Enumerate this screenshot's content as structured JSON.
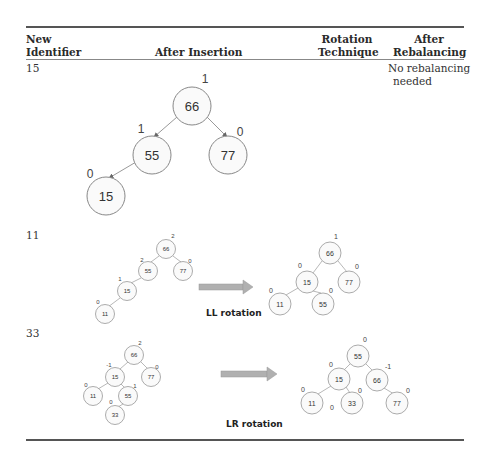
{
  "table": {
    "headers": {
      "new_identifier": [
        "New",
        "Identifier"
      ],
      "after_insertion": "After Insertion",
      "rotation_technique": [
        "Rotation",
        "Technique"
      ],
      "after_rebalancing": [
        "After",
        "Rebalancing"
      ]
    },
    "rows": [
      {
        "identifier": "15",
        "after_insertion_tree": {
          "nodes": [
            {
              "key": "66",
              "balance": "1"
            },
            {
              "key": "55",
              "balance": "1"
            },
            {
              "key": "77",
              "balance": "0"
            },
            {
              "key": "15",
              "balance": "0"
            }
          ]
        },
        "rotation_technique": "",
        "after_rebalancing": [
          "No rebalancing",
          "needed"
        ]
      },
      {
        "identifier": "11",
        "after_insertion_tree": {
          "nodes": [
            {
              "key": "66",
              "balance": "2"
            },
            {
              "key": "55",
              "balance": "2"
            },
            {
              "key": "77",
              "balance": "0"
            },
            {
              "key": "15",
              "balance": "1"
            },
            {
              "key": "11",
              "balance": "0"
            }
          ]
        },
        "rotation_technique": "LL rotation",
        "after_rebalancing_tree": {
          "nodes": [
            {
              "key": "66",
              "balance": "1"
            },
            {
              "key": "15",
              "balance": "0"
            },
            {
              "key": "77",
              "balance": "0"
            },
            {
              "key": "11",
              "balance": "0"
            },
            {
              "key": "55",
              "balance": "0"
            }
          ]
        }
      },
      {
        "identifier": "33",
        "after_insertion_tree": {
          "nodes": [
            {
              "key": "66",
              "balance": "2"
            },
            {
              "key": "15",
              "balance": "-1"
            },
            {
              "key": "77",
              "balance": "0"
            },
            {
              "key": "11",
              "balance": "0"
            },
            {
              "key": "55",
              "balance": "1"
            },
            {
              "key": "33",
              "balance": "0"
            }
          ]
        },
        "rotation_technique": "LR rotation",
        "after_rebalancing_tree": {
          "nodes": [
            {
              "key": "55",
              "balance": "0"
            },
            {
              "key": "15",
              "balance": "0"
            },
            {
              "key": "66",
              "balance": "-1"
            },
            {
              "key": "11",
              "balance": "0"
            },
            {
              "key": "33",
              "balance": "0"
            },
            {
              "key": "77",
              "balance": "0"
            }
          ],
          "extra_label": "0"
        }
      }
    ]
  },
  "colors": {
    "rule": "#555555",
    "node_stroke": "#888888",
    "arrow_fill": "#b0b0b0"
  }
}
